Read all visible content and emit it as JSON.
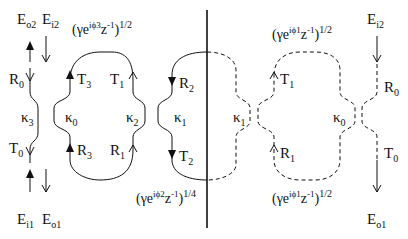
{
  "diagram": {
    "type": "optical ring resonator coupling schematic",
    "colors": {
      "line": "#111111",
      "background": "#ffffff"
    },
    "left_panel": {
      "field_labels": {
        "eo2": {
          "base": "E",
          "sub": "o2"
        },
        "ei2": {
          "base": "E",
          "sub": "i2"
        },
        "ei1": {
          "base": "E",
          "sub": "i1"
        },
        "eo1": {
          "base": "E",
          "sub": "o1"
        }
      },
      "port_labels": {
        "r0": {
          "base": "R",
          "sub": "0"
        },
        "t0": {
          "base": "T",
          "sub": "0"
        },
        "t3": {
          "base": "T",
          "sub": "3"
        },
        "r3": {
          "base": "R",
          "sub": "3"
        },
        "t1": {
          "base": "T",
          "sub": "1"
        },
        "r1": {
          "base": "R",
          "sub": "1"
        },
        "r2": {
          "base": "R",
          "sub": "2"
        },
        "t2": {
          "base": "T",
          "sub": "2"
        }
      },
      "couplers": {
        "k3": {
          "base": "κ",
          "sub": "3"
        },
        "k0": {
          "base": "κ",
          "sub": "0"
        },
        "k2": {
          "base": "κ",
          "sub": "2"
        },
        "k1": {
          "base": "κ",
          "sub": "1"
        }
      },
      "expressions": {
        "top": {
          "open": "(γe",
          "phase": "iϕ3",
          "mid": "z",
          "inv": "-1",
          "close": ")",
          "power": "1/2"
        },
        "bottom": {
          "open": "(γe",
          "phase": "iϕ2",
          "mid": "z",
          "inv": "-1",
          "close": ")",
          "power": "1/4"
        }
      }
    },
    "right_panel": {
      "field_labels": {
        "ei2": {
          "base": "E",
          "sub": "i2"
        },
        "eo1": {
          "base": "E",
          "sub": "o1"
        }
      },
      "port_labels": {
        "t1": {
          "base": "T",
          "sub": "1"
        },
        "r1": {
          "base": "R",
          "sub": "1"
        },
        "r0": {
          "base": "R",
          "sub": "0"
        },
        "t0": {
          "base": "T",
          "sub": "0"
        }
      },
      "couplers": {
        "k1": {
          "base": "κ",
          "sub": "1"
        },
        "k0": {
          "base": "κ",
          "sub": "0"
        }
      },
      "expressions": {
        "top": {
          "open": "(γe",
          "phase": "iϕ1",
          "mid": "z",
          "inv": "-1",
          "close": ")",
          "power": "1/2"
        },
        "bottom": {
          "open": "(γe",
          "phase": "iϕ1",
          "mid": "z",
          "inv": "-1",
          "close": ")",
          "power": "1/2"
        }
      }
    }
  }
}
